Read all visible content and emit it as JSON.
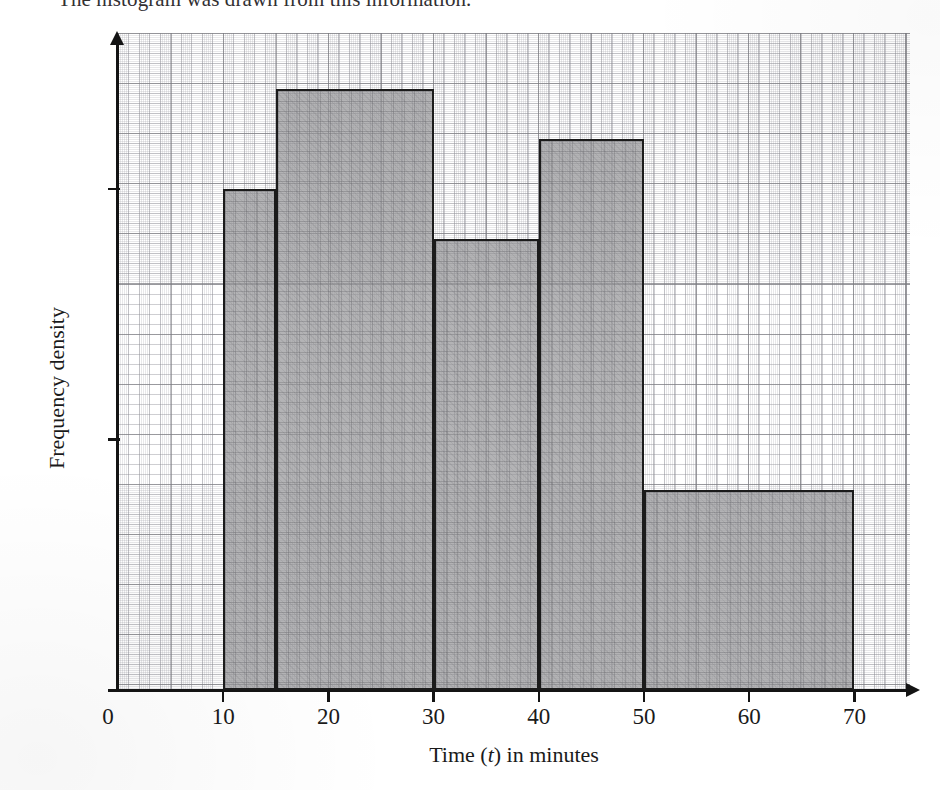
{
  "intro": {
    "text": "The histogram was drawn from this information."
  },
  "axes": {
    "x": {
      "title_prefix": "Time (",
      "title_var": "t",
      "title_suffix": ") in minutes",
      "ticks": [
        {
          "value": 0,
          "label": "0"
        },
        {
          "value": 10,
          "label": "10"
        },
        {
          "value": 20,
          "label": "20"
        },
        {
          "value": 30,
          "label": "30"
        },
        {
          "value": 40,
          "label": "40"
        },
        {
          "value": 50,
          "label": "50"
        },
        {
          "value": 60,
          "label": "60"
        },
        {
          "value": 70,
          "label": "70"
        }
      ],
      "min": 0,
      "max": 75.4
    },
    "y": {
      "title": "Frequency density",
      "ticks": [
        {
          "value": 1,
          "label": "1"
        },
        {
          "value": 2,
          "label": "2"
        }
      ],
      "min": 0,
      "max": 2.62
    }
  },
  "colors": {
    "bar_fill": "#969698",
    "bar_stroke": "#1b1b1b",
    "axis": "#141414",
    "grid_major": "#78787d",
    "grid_minor": "#8c8c94",
    "page": "#ffffff",
    "text": "#1a1a1a"
  },
  "chart_data": {
    "type": "bar",
    "title": "",
    "xlabel": "Time (t) in minutes",
    "ylabel": "Frequency density",
    "xlim": [
      0,
      75.4
    ],
    "ylim": [
      0,
      2.62
    ],
    "grid": true,
    "legend": "none",
    "note": "Histogram with unequal class widths; bar height = frequency density.",
    "bins": [
      {
        "x_start": 10,
        "x_end": 15,
        "width": 5,
        "frequency_density": 2.0,
        "frequency": 10
      },
      {
        "x_start": 15,
        "x_end": 30,
        "width": 15,
        "frequency_density": 2.4,
        "frequency": 36
      },
      {
        "x_start": 30,
        "x_end": 40,
        "width": 10,
        "frequency_density": 1.8,
        "frequency": 18
      },
      {
        "x_start": 40,
        "x_end": 50,
        "width": 10,
        "frequency_density": 2.2,
        "frequency": 22
      },
      {
        "x_start": 50,
        "x_end": 70,
        "width": 20,
        "frequency_density": 0.8,
        "frequency": 16
      }
    ],
    "categories": [
      "10-15",
      "15-30",
      "30-40",
      "40-50",
      "50-70"
    ],
    "values": [
      2.0,
      2.4,
      1.8,
      2.2,
      0.8
    ]
  }
}
